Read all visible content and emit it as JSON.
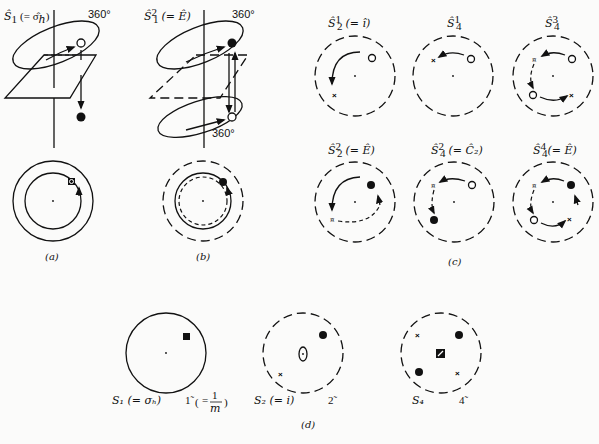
{
  "figure": {
    "panels": {
      "a": {
        "caption": "(a)",
        "title_op": "Ŝ",
        "title_sub": "1",
        "title_paren": "(= σ̂",
        "title_paren_sub": "h",
        "title_close": ")",
        "rotation_label": "360°"
      },
      "b": {
        "caption": "(b)",
        "title_op": "Ŝ",
        "title_sub": "1",
        "title_sup": "2",
        "title_paren": "(= Ê)",
        "rotation_label_top": "360°",
        "rotation_label_bottom": "360°"
      },
      "c": {
        "caption": "(c)",
        "diagrams": [
          {
            "op": "Ŝ",
            "sup": "1",
            "sub": "2",
            "note": "(= î)"
          },
          {
            "op": "Ŝ",
            "sup": "1",
            "sub": "4",
            "note": ""
          },
          {
            "op": "Ŝ",
            "sup": "3",
            "sub": "4",
            "note": ""
          },
          {
            "op": "Ŝ",
            "sup": "2",
            "sub": "2",
            "note": "(= Ê)"
          },
          {
            "op": "Ŝ",
            "sup": "2",
            "sub": "4",
            "note": "(= Ĉ₂)"
          },
          {
            "op": "Ŝ",
            "sup": "4",
            "sub": "4",
            "note": "(= Ê)"
          }
        ]
      },
      "d": {
        "caption": "(d)",
        "diagrams": [
          {
            "schoenflies": "S₁ (= σₕ)",
            "hm": "1̃",
            "hm_note_eq": "=",
            "hm_note_num": "1",
            "hm_note_den": "m"
          },
          {
            "schoenflies": "S₂ (= i)",
            "hm": "2̃"
          },
          {
            "schoenflies": "S₄",
            "hm": "4̃"
          }
        ]
      }
    }
  }
}
